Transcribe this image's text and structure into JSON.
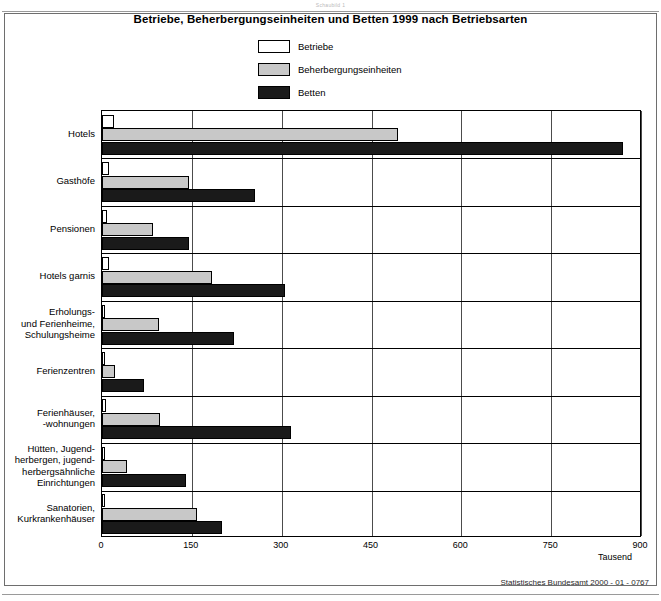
{
  "top_caption": "Schaubild 1",
  "figure": {
    "title": "Betriebe, Beherbergungseinheiten und Betten 1999 nach Betriebsarten",
    "source": "Statistisches Bundesamt 2000 - 01 - 0767",
    "unit": "Tausend"
  },
  "legend": [
    {
      "label": "Betriebe",
      "color": "#ffffff",
      "swatch": "swatch-betriebe"
    },
    {
      "label": "Beherbergungseinheiten",
      "color": "#c8c8c8",
      "swatch": "swatch-beherbergungseinheiten"
    },
    {
      "label": "Betten",
      "color": "#1a1a1a",
      "swatch": "swatch-betten"
    }
  ],
  "chart_data": {
    "type": "bar",
    "orientation": "horizontal",
    "title": "Betriebe, Beherbergungseinheiten und Betten 1999 nach Betriebsarten",
    "xlabel": "Tausend",
    "ylabel": "",
    "xlim": [
      0,
      900
    ],
    "xticks": [
      0,
      150,
      300,
      450,
      600,
      750,
      900
    ],
    "grid": true,
    "legend_position": "top-center",
    "categories": [
      "Hotels",
      "Gasthöfe",
      "Pensionen",
      "Hotels garnis",
      "Erholungs- und Ferienheime, Schulungsheime",
      "Ferienzentren",
      "Ferienhäuser, -wohnungen",
      "Hütten, Jugendherbergen, jugendherbergsähnliche Einrichtungen",
      "Sanatorien, Kurkrankenhäuser"
    ],
    "category_lines": [
      [
        "Hotels"
      ],
      [
        "Gasthöfe"
      ],
      [
        "Pensionen"
      ],
      [
        "Hotels garnis"
      ],
      [
        "Erholungs-",
        "und Ferienheime,",
        "Schulungsheime"
      ],
      [
        "Ferienzentren"
      ],
      [
        "Ferienhäuser,",
        "-wohnungen"
      ],
      [
        "Hütten, Jugend-",
        "herbergen, jugend-",
        "herbergsähnliche",
        "Einrichtungen"
      ],
      [
        "Sanatorien,",
        "Kurkrankenhäuser"
      ]
    ],
    "series": [
      {
        "name": "Betriebe",
        "color": "#ffffff",
        "values": [
          20,
          11,
          9,
          11,
          5,
          2,
          7,
          3,
          1
        ]
      },
      {
        "name": "Beherbergungseinheiten",
        "color": "#c8c8c8",
        "values": [
          495,
          145,
          85,
          183,
          95,
          22,
          97,
          42,
          158
        ]
      },
      {
        "name": "Betten",
        "color": "#1a1a1a",
        "values": [
          870,
          255,
          145,
          305,
          220,
          70,
          315,
          140,
          200
        ]
      }
    ]
  }
}
